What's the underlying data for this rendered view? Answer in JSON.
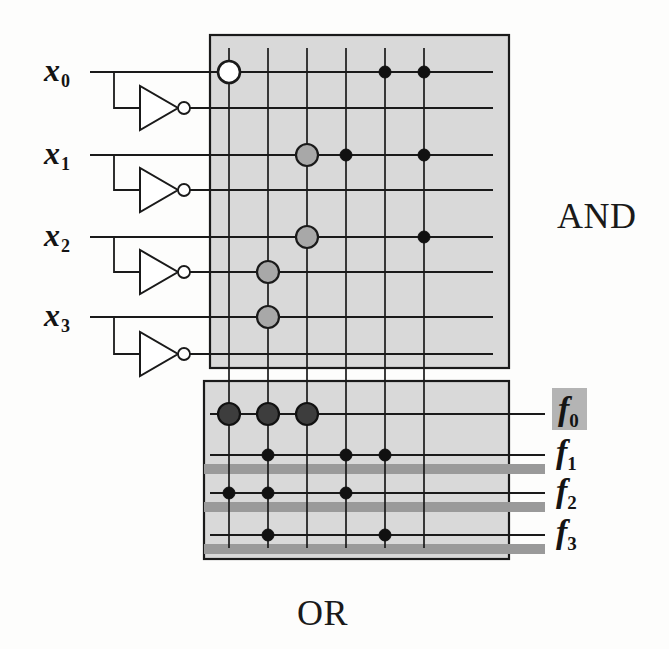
{
  "figure": {
    "kind": "pla-diagram",
    "width": 669,
    "height": 649,
    "background": "#fdfdfc"
  },
  "colors": {
    "plane_fill": "#d9d9d9",
    "plane_stroke": "#1a1a1a",
    "wire": "#1a1a1a",
    "dot_black": "#111111",
    "dot_gray": "#a8a8a8",
    "dot_hollow_fill": "#ffffff",
    "or_bar_gray": "#9a9a9a",
    "label_highlight": "#b4b4b4",
    "text": "#141414"
  },
  "planes": {
    "and": {
      "name": "AND",
      "label": "AND",
      "label_x": 557,
      "label_y": 195,
      "box": {
        "x": 210,
        "y": 35,
        "w": 299,
        "h": 333
      }
    },
    "or": {
      "name": "OR",
      "label": "OR",
      "label_x": 297,
      "label_y": 592,
      "box": {
        "x": 204,
        "y": 381,
        "w": 305,
        "h": 178
      }
    }
  },
  "geometry": {
    "product_term_columns": [
      229,
      268,
      307,
      346,
      385,
      424
    ],
    "input_row_y": [
      72,
      108,
      155,
      190,
      237,
      272,
      317,
      354
    ],
    "output_row_y": [
      414,
      455,
      493,
      535
    ],
    "and_row_line_start_x": 90,
    "and_row_line_end_x": 493,
    "or_row_line_start_x": 210,
    "or_row_line_end_x": 545,
    "or_gray_bar_start_x": 204,
    "or_gray_bar_end_x": 545,
    "or_gray_bar_offsets": [
      14,
      14,
      14
    ],
    "column_top_y": 48,
    "column_bottom_y": 548
  },
  "inputs": [
    {
      "name": "x0",
      "label": "x",
      "sub": "0",
      "label_x": 44,
      "label_y": 52,
      "true_row": 0,
      "comp_row": 1,
      "wire_start_x": 88,
      "tap_x": 114,
      "inverter": {
        "x": 140,
        "y": 108,
        "w": 38,
        "h": 44,
        "bubble_r": 6
      }
    },
    {
      "name": "x1",
      "label": "x",
      "sub": "1",
      "label_x": 44,
      "label_y": 135,
      "true_row": 2,
      "comp_row": 3,
      "wire_start_x": 88,
      "tap_x": 114,
      "inverter": {
        "x": 140,
        "y": 190,
        "w": 38,
        "h": 44,
        "bubble_r": 6
      }
    },
    {
      "name": "x2",
      "label": "x",
      "sub": "2",
      "label_x": 44,
      "label_y": 217,
      "true_row": 4,
      "comp_row": 5,
      "wire_start_x": 88,
      "tap_x": 114,
      "inverter": {
        "x": 140,
        "y": 272,
        "w": 38,
        "h": 44,
        "bubble_r": 6
      }
    },
    {
      "name": "x3",
      "label": "x",
      "sub": "3",
      "label_x": 44,
      "label_y": 297,
      "true_row": 6,
      "comp_row": 7,
      "wire_start_x": 88,
      "tap_x": 114,
      "inverter": {
        "x": 140,
        "y": 354,
        "w": 38,
        "h": 44,
        "bubble_r": 6
      }
    }
  ],
  "outputs": [
    {
      "name": "f0",
      "label": "f",
      "sub": "0",
      "label_x": 552,
      "label_y": 388,
      "row": 0,
      "highlighted": true
    },
    {
      "name": "f1",
      "label": "f",
      "sub": "1",
      "label_x": 556,
      "label_y": 433,
      "row": 1,
      "highlighted": false
    },
    {
      "name": "f2",
      "label": "f",
      "sub": "2",
      "label_x": 556,
      "label_y": 472,
      "row": 2,
      "highlighted": false
    },
    {
      "name": "f3",
      "label": "f",
      "sub": "3",
      "label_x": 556,
      "label_y": 513,
      "row": 3,
      "highlighted": false
    }
  ],
  "and_connections": [
    {
      "name": "and-x0-col1-hollow",
      "col": 0,
      "row": 0,
      "style": "hollow-large",
      "r": 11
    },
    {
      "name": "and-x0-col5",
      "col": 4,
      "row": 0,
      "style": "black-small",
      "r": 6
    },
    {
      "name": "and-x0-col6",
      "col": 5,
      "row": 0,
      "style": "black-small",
      "r": 6
    },
    {
      "name": "and-x1-col3-gray",
      "col": 2,
      "row": 2,
      "style": "gray-large",
      "r": 11
    },
    {
      "name": "and-x1-col4",
      "col": 3,
      "row": 2,
      "style": "black-small",
      "r": 6
    },
    {
      "name": "and-x1-col6",
      "col": 5,
      "row": 2,
      "style": "black-small",
      "r": 6
    },
    {
      "name": "and-x2-col3-gray",
      "col": 2,
      "row": 4,
      "style": "gray-large",
      "r": 11
    },
    {
      "name": "and-x2-col6",
      "col": 5,
      "row": 4,
      "style": "black-small",
      "r": 6
    },
    {
      "name": "and-x2comp-col2-gray",
      "col": 1,
      "row": 5,
      "style": "gray-large",
      "r": 11
    },
    {
      "name": "and-x3-col2-gray",
      "col": 1,
      "row": 6,
      "style": "gray-large",
      "r": 11
    }
  ],
  "or_connections": [
    {
      "name": "or-f0-col1",
      "col": 0,
      "row": 0,
      "style": "dark-large",
      "r": 11
    },
    {
      "name": "or-f0-col2",
      "col": 1,
      "row": 0,
      "style": "dark-large",
      "r": 11
    },
    {
      "name": "or-f0-col3",
      "col": 2,
      "row": 0,
      "style": "dark-large",
      "r": 11
    },
    {
      "name": "or-f1-col2",
      "col": 1,
      "row": 1,
      "style": "black-small",
      "r": 6
    },
    {
      "name": "or-f1-col4",
      "col": 3,
      "row": 1,
      "style": "black-small",
      "r": 6
    },
    {
      "name": "or-f1-col5",
      "col": 4,
      "row": 1,
      "style": "black-small",
      "r": 6
    },
    {
      "name": "or-f2-col1",
      "col": 0,
      "row": 2,
      "style": "black-small",
      "r": 6
    },
    {
      "name": "or-f2-col2",
      "col": 1,
      "row": 2,
      "style": "black-small",
      "r": 6
    },
    {
      "name": "or-f2-col4",
      "col": 3,
      "row": 2,
      "style": "black-small",
      "r": 6
    },
    {
      "name": "or-f3-col2",
      "col": 1,
      "row": 3,
      "style": "black-small",
      "r": 6
    },
    {
      "name": "or-f3-col5",
      "col": 4,
      "row": 3,
      "style": "black-small",
      "r": 6
    }
  ],
  "logic": {
    "product_terms": [
      "P1",
      "P2",
      "P3",
      "P4",
      "P5",
      "P6"
    ],
    "notes": "Gray/hollow circles mark programmed AND-plane crosspoints; filled dots mark OR-plane crosspoints."
  }
}
